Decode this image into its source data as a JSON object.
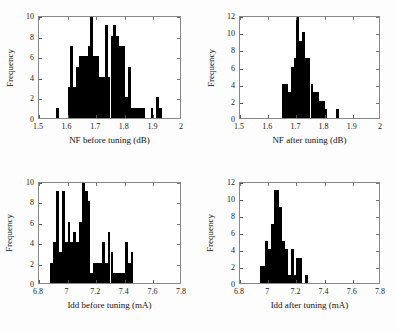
{
  "figure": {
    "background": "#ffffff",
    "bar_color": "#000000",
    "axis_color": "#555555",
    "panel_count": 4
  },
  "chart_data": [
    {
      "id": "nf-before-tuning",
      "type": "bar",
      "title": "",
      "xlabel": "NF before tuning (dB)",
      "ylabel": "Frequency",
      "xlim": [
        1.5,
        2.0
      ],
      "ylim": [
        0,
        10
      ],
      "xticks": [
        1.5,
        1.6,
        1.7,
        1.8,
        1.9,
        2.0
      ],
      "xticklabels": [
        "1.5",
        "1.6",
        "1.7",
        "1.8",
        "1.9",
        "2"
      ],
      "yticks": [
        0,
        2,
        4,
        6,
        8,
        10
      ],
      "yticklabels": [
        "0",
        "2",
        "4",
        "6",
        "8",
        "10"
      ],
      "grid": false,
      "legend": null,
      "bin_width": 0.01,
      "bin_starts": [
        1.56,
        1.57,
        1.58,
        1.59,
        1.6,
        1.61,
        1.62,
        1.63,
        1.64,
        1.65,
        1.66,
        1.67,
        1.68,
        1.69,
        1.7,
        1.71,
        1.72,
        1.73,
        1.74,
        1.75,
        1.76,
        1.77,
        1.78,
        1.79,
        1.8,
        1.81,
        1.82,
        1.83,
        1.84,
        1.85,
        1.86,
        1.87,
        1.88,
        1.89,
        1.9,
        1.91,
        1.92,
        1.93
      ],
      "values": [
        1,
        0,
        0,
        0,
        3,
        7,
        3,
        5,
        6,
        6,
        6,
        7,
        10,
        6,
        6,
        4,
        4,
        9,
        4,
        8,
        9,
        8,
        7,
        7,
        2,
        5,
        1,
        1,
        1,
        1,
        1,
        0,
        0,
        1,
        0,
        2,
        1,
        0
      ]
    },
    {
      "id": "nf-after-tuning",
      "type": "bar",
      "title": "",
      "xlabel": "NF after tuning (dB)",
      "ylabel": "Frequency",
      "xlim": [
        1.5,
        2.0
      ],
      "ylim": [
        0,
        12
      ],
      "xticks": [
        1.5,
        1.6,
        1.7,
        1.8,
        1.9,
        2.0
      ],
      "xticklabels": [
        "1.5",
        "1.6",
        "1.7",
        "1.8",
        "1.9",
        "2"
      ],
      "yticks": [
        0,
        2,
        4,
        6,
        8,
        10,
        12
      ],
      "yticklabels": [
        "0",
        "2",
        "4",
        "6",
        "8",
        "10",
        "12"
      ],
      "grid": false,
      "legend": null,
      "bin_width": 0.01,
      "bin_starts": [
        1.65,
        1.66,
        1.67,
        1.68,
        1.69,
        1.7,
        1.71,
        1.72,
        1.73,
        1.74,
        1.75,
        1.76,
        1.77,
        1.78,
        1.79,
        1.8,
        1.84
      ],
      "values": [
        4,
        4,
        3,
        6,
        7,
        12,
        9,
        10,
        7,
        7,
        4,
        3,
        3,
        2,
        2,
        1,
        1
      ]
    },
    {
      "id": "idd-before-tuning",
      "type": "bar",
      "title": "",
      "xlabel": "Idd before tuning (mA)",
      "ylabel": "Frequency",
      "xlim": [
        6.8,
        7.8
      ],
      "ylim": [
        0,
        10
      ],
      "xticks": [
        6.8,
        7.0,
        7.2,
        7.4,
        7.6,
        7.8
      ],
      "xticklabels": [
        "6.8",
        "7",
        "7.2",
        "7.4",
        "7.6",
        "7.8"
      ],
      "yticks": [
        0,
        2,
        4,
        6,
        8,
        10
      ],
      "yticklabels": [
        "0",
        "2",
        "4",
        "6",
        "8",
        "10"
      ],
      "grid": false,
      "legend": null,
      "bin_width": 0.02,
      "bin_starts": [
        6.88,
        6.9,
        6.92,
        6.94,
        6.96,
        6.98,
        7.0,
        7.02,
        7.04,
        7.06,
        7.08,
        7.1,
        7.12,
        7.14,
        7.16,
        7.18,
        7.2,
        7.22,
        7.24,
        7.26,
        7.28,
        7.3,
        7.32,
        7.34,
        7.36,
        7.38,
        7.4,
        7.42,
        7.44,
        7.46
      ],
      "values": [
        2,
        4,
        9,
        3,
        9,
        4,
        6,
        4,
        5,
        4,
        6,
        10,
        9,
        8,
        1,
        2,
        2,
        2,
        4,
        2,
        5,
        3,
        1,
        1,
        1,
        1,
        4,
        2,
        3,
        0
      ]
    },
    {
      "id": "idd-after-tuning",
      "type": "bar",
      "title": "",
      "xlabel": "Idd after tuning (mA)",
      "ylabel": "Frequency",
      "xlim": [
        6.8,
        7.8
      ],
      "ylim": [
        0,
        12
      ],
      "xticks": [
        6.8,
        7.0,
        7.2,
        7.4,
        7.6,
        7.8
      ],
      "xticklabels": [
        "6.8",
        "7",
        "7.2",
        "7.4",
        "7.6",
        "7.8"
      ],
      "yticks": [
        0,
        2,
        4,
        6,
        8,
        10,
        12
      ],
      "yticklabels": [
        "0",
        "2",
        "4",
        "6",
        "8",
        "10",
        "12"
      ],
      "grid": false,
      "legend": null,
      "bin_width": 0.02,
      "bin_starts": [
        6.94,
        6.96,
        6.98,
        7.0,
        7.02,
        7.04,
        7.06,
        7.08,
        7.1,
        7.12,
        7.14,
        7.16,
        7.18,
        7.2,
        7.22,
        7.24,
        7.26
      ],
      "values": [
        2,
        2,
        5,
        4,
        7,
        11,
        11,
        9,
        5,
        4,
        1,
        4,
        1,
        3,
        3,
        0,
        1
      ]
    }
  ]
}
